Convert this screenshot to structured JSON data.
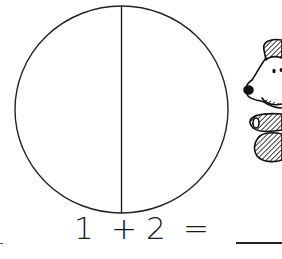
{
  "worksheet": {
    "equation": {
      "operand_a": "1",
      "operator": "+",
      "operand_b": "2",
      "equals": "=",
      "answer": ""
    },
    "circle": {
      "parts": 2,
      "divider": "vertical"
    },
    "illustration": "dog-cartoon",
    "stroke_color": "#222222"
  }
}
